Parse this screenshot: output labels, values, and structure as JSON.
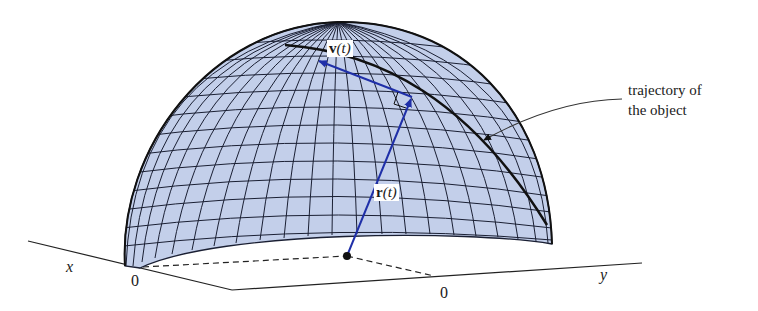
{
  "figure": {
    "type": "3d-diagram",
    "colors": {
      "surface_fill": "#c3cfea",
      "grid_lines": "#1a1f33",
      "vector": "#1f2fa8",
      "trajectory": "#111111",
      "axes": "#222222"
    }
  },
  "labels": {
    "velocity_bold": "v",
    "velocity_arg": "(t)",
    "position_bold": "r",
    "position_arg": "(t)",
    "annotation_line1": "trajectory of",
    "annotation_line2": "the object",
    "x_axis": "x",
    "y_axis": "y",
    "x_origin": "0",
    "y_origin": "0"
  }
}
